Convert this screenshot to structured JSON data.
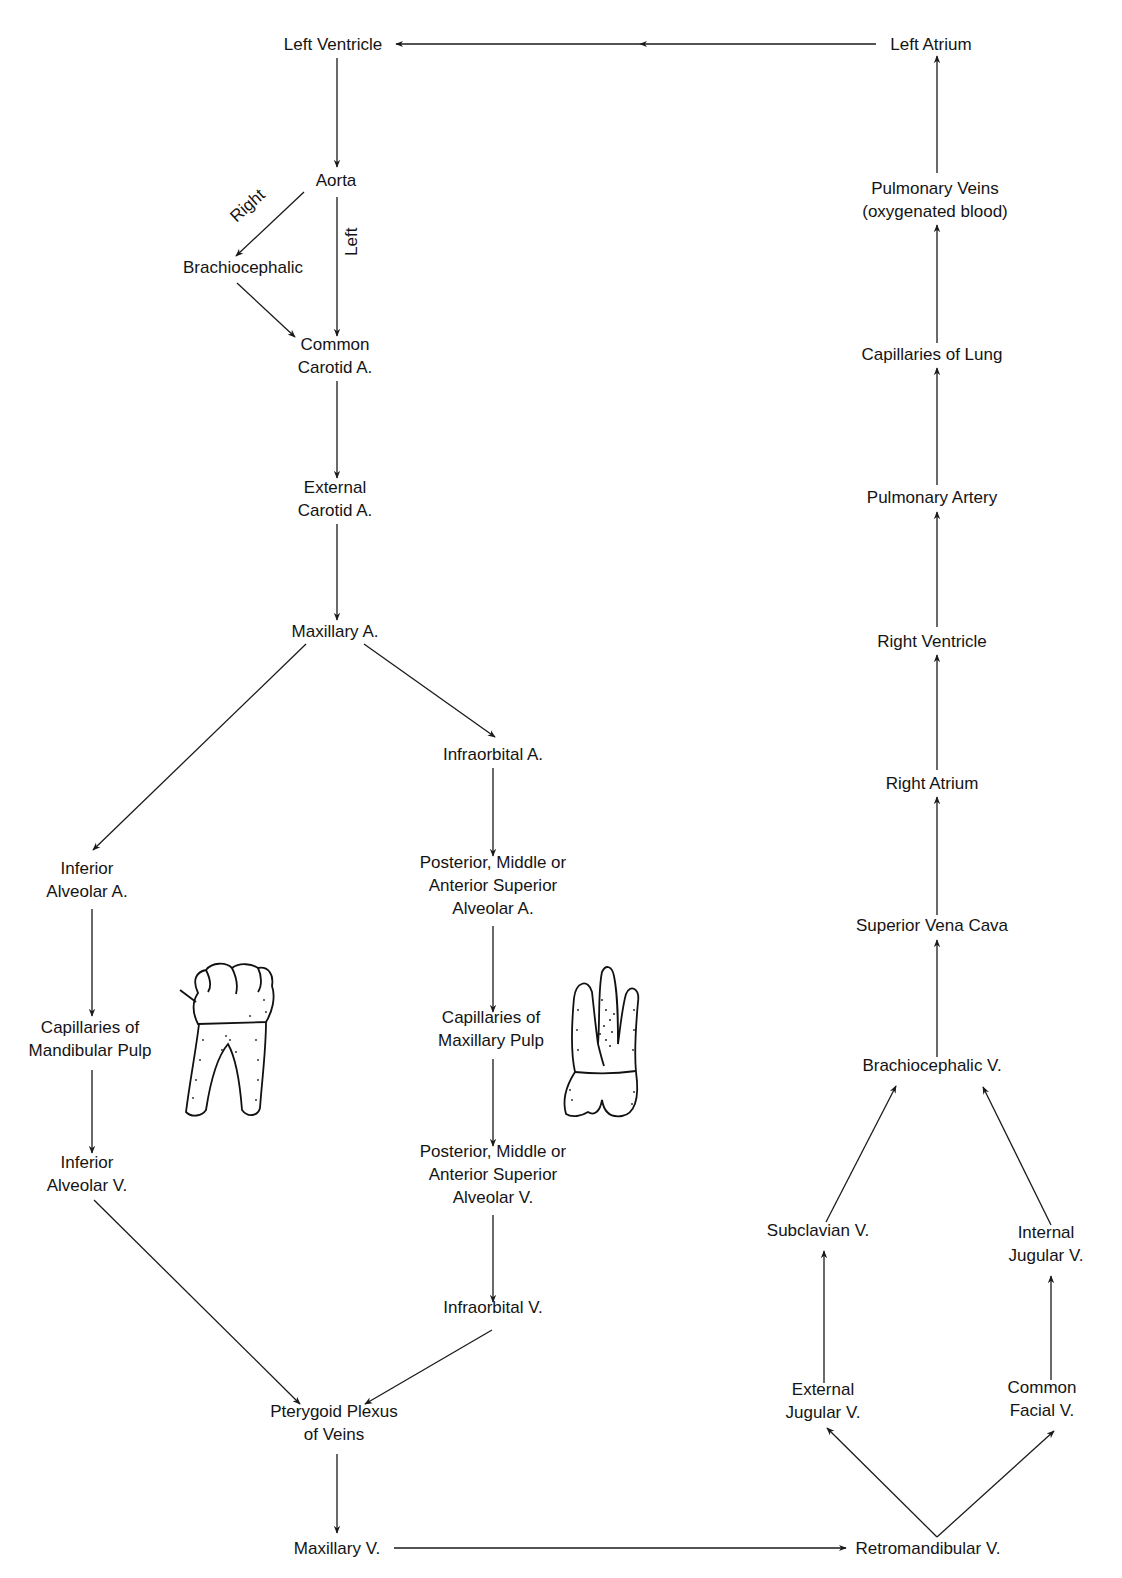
{
  "diagram": {
    "nodes": {
      "left_ventricle": {
        "lines": [
          "Left Ventricle"
        ]
      },
      "left_atrium": {
        "lines": [
          "Left Atrium"
        ]
      },
      "aorta": {
        "lines": [
          "Aorta"
        ]
      },
      "brachiocephalic": {
        "lines": [
          "Brachiocephalic"
        ]
      },
      "common_carotid": {
        "lines": [
          "Common",
          "Carotid A."
        ]
      },
      "external_carotid": {
        "lines": [
          "External",
          "Carotid A."
        ]
      },
      "maxillary_a": {
        "lines": [
          "Maxillary A."
        ]
      },
      "infraorbital_a": {
        "lines": [
          "Infraorbital A."
        ]
      },
      "inferior_alveolar_a": {
        "lines": [
          "Inferior",
          "Alveolar A."
        ]
      },
      "psa_a": {
        "lines": [
          "Posterior, Middle or",
          "Anterior Superior",
          "Alveolar A."
        ]
      },
      "cap_mandibular": {
        "lines": [
          "Capillaries of",
          "Mandibular Pulp"
        ]
      },
      "cap_maxillary": {
        "lines": [
          "Capillaries of",
          "Maxillary Pulp"
        ]
      },
      "inferior_alveolar_v": {
        "lines": [
          "Inferior",
          "Alveolar V."
        ]
      },
      "psa_v": {
        "lines": [
          "Posterior, Middle or",
          "Anterior Superior",
          "Alveolar V."
        ]
      },
      "infraorbital_v": {
        "lines": [
          "Infraorbital V."
        ]
      },
      "pterygoid_plexus": {
        "lines": [
          "Pterygoid Plexus",
          "of Veins"
        ]
      },
      "maxillary_v": {
        "lines": [
          "Maxillary V."
        ]
      },
      "retromandibular_v": {
        "lines": [
          "Retromandibular V."
        ]
      },
      "external_jugular_v": {
        "lines": [
          "External",
          "Jugular V."
        ]
      },
      "common_facial_v": {
        "lines": [
          "Common",
          "Facial V."
        ]
      },
      "subclavian_v": {
        "lines": [
          "Subclavian V."
        ]
      },
      "internal_jugular_v": {
        "lines": [
          "Internal",
          "Jugular V."
        ]
      },
      "brachiocephalic_v": {
        "lines": [
          "Brachiocephalic V."
        ]
      },
      "superior_vena_cava": {
        "lines": [
          "Superior Vena Cava"
        ]
      },
      "right_atrium": {
        "lines": [
          "Right Atrium"
        ]
      },
      "right_ventricle": {
        "lines": [
          "Right Ventricle"
        ]
      },
      "pulmonary_artery": {
        "lines": [
          "Pulmonary Artery"
        ]
      },
      "capillaries_lung": {
        "lines": [
          "Capillaries of Lung"
        ]
      },
      "pulmonary_veins": {
        "lines": [
          "Pulmonary Veins",
          "(oxygenated blood)"
        ]
      }
    },
    "edge_labels": {
      "right": "Right",
      "left": "Left"
    },
    "illustrations": {
      "mandibular_tooth": "mandibular-molar-illustration",
      "maxillary_tooth": "maxillary-molar-illustration"
    },
    "edges": [
      [
        "left_atrium",
        "left_ventricle"
      ],
      [
        "left_ventricle",
        "aorta"
      ],
      [
        "aorta",
        "brachiocephalic",
        "Right"
      ],
      [
        "aorta",
        "common_carotid",
        "Left"
      ],
      [
        "brachiocephalic",
        "common_carotid"
      ],
      [
        "common_carotid",
        "external_carotid"
      ],
      [
        "external_carotid",
        "maxillary_a"
      ],
      [
        "maxillary_a",
        "inferior_alveolar_a"
      ],
      [
        "maxillary_a",
        "infraorbital_a"
      ],
      [
        "inferior_alveolar_a",
        "cap_mandibular"
      ],
      [
        "cap_mandibular",
        "inferior_alveolar_v"
      ],
      [
        "infraorbital_a",
        "psa_a"
      ],
      [
        "psa_a",
        "cap_maxillary"
      ],
      [
        "cap_maxillary",
        "psa_v"
      ],
      [
        "psa_v",
        "infraorbital_v"
      ],
      [
        "inferior_alveolar_v",
        "pterygoid_plexus"
      ],
      [
        "infraorbital_v",
        "pterygoid_plexus"
      ],
      [
        "pterygoid_plexus",
        "maxillary_v"
      ],
      [
        "maxillary_v",
        "retromandibular_v"
      ],
      [
        "retromandibular_v",
        "external_jugular_v"
      ],
      [
        "retromandibular_v",
        "common_facial_v"
      ],
      [
        "external_jugular_v",
        "subclavian_v"
      ],
      [
        "common_facial_v",
        "internal_jugular_v"
      ],
      [
        "subclavian_v",
        "brachiocephalic_v"
      ],
      [
        "internal_jugular_v",
        "brachiocephalic_v"
      ],
      [
        "brachiocephalic_v",
        "superior_vena_cava"
      ],
      [
        "superior_vena_cava",
        "right_atrium"
      ],
      [
        "right_atrium",
        "right_ventricle"
      ],
      [
        "right_ventricle",
        "pulmonary_artery"
      ],
      [
        "pulmonary_artery",
        "capillaries_lung"
      ],
      [
        "capillaries_lung",
        "pulmonary_veins"
      ],
      [
        "pulmonary_veins",
        "left_atrium"
      ]
    ]
  }
}
